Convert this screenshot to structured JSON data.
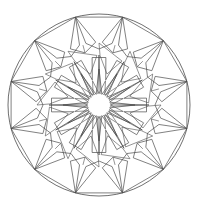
{
  "document": {
    "title": "Mandala Coloring Page",
    "type": "line-art-illustration",
    "subject": "circular geometric mandala"
  },
  "canvas": {
    "width": 201,
    "height": 212,
    "background_color": "#ffffff"
  },
  "artwork": {
    "name": "twelve-fold-geometric-mandala",
    "symmetry_order": 12,
    "line_color": "#4a4a4a",
    "line_width": 0.7,
    "fill": "none",
    "center": {
      "x": 99,
      "y": 105
    },
    "rings": [
      {
        "name": "outer-circle",
        "shape": "circle",
        "radius": 91
      },
      {
        "name": "outer-polygon-ring",
        "shape": "dodecagon-pentagon-band",
        "outer_radius": 91,
        "inner_radius": 56,
        "count": 12
      },
      {
        "name": "middle-square-ring",
        "shape": "overlapping-rotated-squares",
        "outer_radius": 62,
        "inner_radius": 26,
        "count": 12
      },
      {
        "name": "inner-star-ring",
        "shape": "twelve-point-star-band",
        "outer_radius": 48,
        "inner_radius": 20,
        "count": 12
      },
      {
        "name": "center-star",
        "shape": "twelve-point-star",
        "outer_radius": 36,
        "inner_radius": 11,
        "points": 12
      }
    ]
  }
}
